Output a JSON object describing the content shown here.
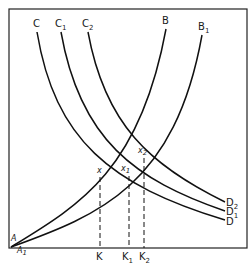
{
  "diagram": {
    "type": "economics-curve-diagram",
    "origin_labels": {
      "A": "A",
      "A1": {
        "main": "A",
        "sub": "1"
      }
    },
    "demand_curves": [
      {
        "id": "CD",
        "start_label": {
          "main": "C",
          "sub": ""
        },
        "end_label": {
          "main": "D",
          "sub": ""
        }
      },
      {
        "id": "C1D1",
        "start_label": {
          "main": "C",
          "sub": "1"
        },
        "end_label": {
          "main": "D",
          "sub": "1"
        }
      },
      {
        "id": "C2D2",
        "start_label": {
          "main": "C",
          "sub": "2"
        },
        "end_label": {
          "main": "D",
          "sub": "2"
        }
      }
    ],
    "rising_curves": [
      {
        "id": "AB",
        "end_label": {
          "main": "B",
          "sub": ""
        }
      },
      {
        "id": "A1B1",
        "end_label": {
          "main": "B",
          "sub": "1"
        }
      }
    ],
    "intersections": [
      {
        "id": "x",
        "label": {
          "main": "x",
          "sub": ""
        },
        "axis_label": {
          "main": "K",
          "sub": ""
        }
      },
      {
        "id": "x1",
        "label": {
          "main": "x",
          "sub": "1"
        },
        "axis_label": {
          "main": "K",
          "sub": "1"
        }
      },
      {
        "id": "x2",
        "label": {
          "main": "x",
          "sub": "2"
        },
        "axis_label": {
          "main": "K",
          "sub": "2"
        }
      }
    ]
  }
}
